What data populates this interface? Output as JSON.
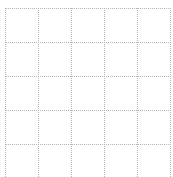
{
  "grid": {
    "columns": 5,
    "rows": 5,
    "line_color": "#b4b4b4",
    "line_style": "dotted",
    "background": "#ffffff",
    "x_lines": [
      5,
      38,
      71,
      104,
      137,
      170
    ],
    "y_lines": [
      8,
      42,
      76,
      110,
      144
    ],
    "bottom_extent": 177
  }
}
